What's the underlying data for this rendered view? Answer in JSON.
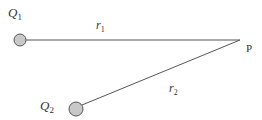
{
  "diagram": {
    "charges": [
      {
        "name": "Q",
        "subscript": "1",
        "cx": 20,
        "cy": 40,
        "r": 6,
        "label_x": 8,
        "label_y": 14
      },
      {
        "name": "Q",
        "subscript": "2",
        "cx": 76,
        "cy": 109,
        "r": 7,
        "label_x": 40,
        "label_y": 111
      }
    ],
    "point": {
      "label": "P",
      "x": 240,
      "y": 40,
      "label_x": 247,
      "label_y": 52
    },
    "distances": [
      {
        "name": "r",
        "subscript": "1",
        "label_x": 96,
        "label_y": 28
      },
      {
        "name": "r",
        "subscript": "2",
        "label_x": 169,
        "label_y": 91
      }
    ],
    "colors": {
      "line": "#555555",
      "charge_fill": "#c8c8c8",
      "charge_stroke": "#555555",
      "text": "#333333"
    }
  }
}
